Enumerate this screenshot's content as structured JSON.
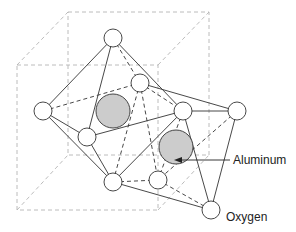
{
  "diagram": {
    "type": "crystal-structure",
    "labels": {
      "aluminum": "Aluminum",
      "oxygen": "Oxygen"
    },
    "colors": {
      "oxygen_fill": "#ffffff",
      "aluminum_fill": "#cccccc",
      "bond": "#333333",
      "cube": "#b4b4b4"
    },
    "atoms": {
      "oxygen": [
        {
          "id": "O1",
          "x": 113,
          "y": 38
        },
        {
          "id": "O2",
          "x": 43,
          "y": 111
        },
        {
          "id": "O3",
          "x": 140,
          "y": 83
        },
        {
          "id": "O4",
          "x": 183,
          "y": 111
        },
        {
          "id": "O5",
          "x": 237,
          "y": 111
        },
        {
          "id": "O6",
          "x": 87,
          "y": 137
        },
        {
          "id": "O7",
          "x": 113,
          "y": 182
        },
        {
          "id": "O8",
          "x": 158,
          "y": 180
        },
        {
          "id": "O9",
          "x": 211,
          "y": 210
        }
      ],
      "aluminum": [
        {
          "id": "Al1",
          "x": 113,
          "y": 111
        },
        {
          "id": "Al2",
          "x": 176,
          "y": 147
        }
      ]
    }
  }
}
